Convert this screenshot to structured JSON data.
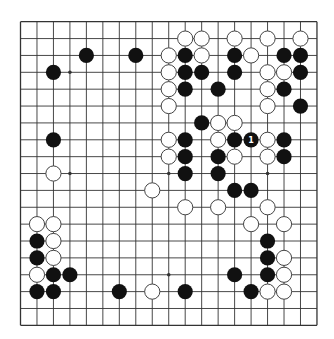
{
  "board": {
    "size": 19,
    "origin_x": 20.5,
    "origin_y": 21.7,
    "step_x": 16.47,
    "step_y": 16.87,
    "stone_radius": 7.6,
    "colors": {
      "background": "#ffffff",
      "line": "#333333",
      "black_stone": "#111111",
      "white_stone_fill": "#ffffff",
      "white_stone_stroke": "#444444",
      "mark": "#ffffff"
    },
    "hoshi": [
      [
        3,
        3
      ],
      [
        9,
        3
      ],
      [
        15,
        3
      ],
      [
        3,
        9
      ],
      [
        9,
        9
      ],
      [
        15,
        9
      ],
      [
        3,
        15
      ],
      [
        9,
        15
      ],
      [
        15,
        15
      ]
    ],
    "black": [
      [
        4,
        2
      ],
      [
        7,
        2
      ],
      [
        2,
        3
      ],
      [
        2,
        7
      ],
      [
        10,
        2
      ],
      [
        10,
        3
      ],
      [
        11,
        3
      ],
      [
        10,
        4
      ],
      [
        12,
        4
      ],
      [
        13,
        2
      ],
      [
        13,
        3
      ],
      [
        16,
        2
      ],
      [
        17,
        2
      ],
      [
        17,
        3
      ],
      [
        16,
        4
      ],
      [
        17,
        5
      ],
      [
        11,
        6
      ],
      [
        10,
        7
      ],
      [
        13,
        7
      ],
      [
        14,
        7
      ],
      [
        16,
        7
      ],
      [
        10,
        8
      ],
      [
        12,
        8
      ],
      [
        16,
        8
      ],
      [
        10,
        9
      ],
      [
        12,
        9
      ],
      [
        13,
        10
      ],
      [
        14,
        10
      ],
      [
        15,
        13
      ],
      [
        15,
        14
      ],
      [
        13,
        15
      ],
      [
        15,
        15
      ],
      [
        14,
        16
      ],
      [
        1,
        13
      ],
      [
        1,
        14
      ],
      [
        2,
        15
      ],
      [
        3,
        15
      ],
      [
        1,
        16
      ],
      [
        2,
        16
      ],
      [
        6,
        16
      ],
      [
        10,
        16
      ]
    ],
    "white": [
      [
        10,
        1
      ],
      [
        11,
        1
      ],
      [
        13,
        1
      ],
      [
        15,
        1
      ],
      [
        17,
        1
      ],
      [
        9,
        2
      ],
      [
        11,
        2
      ],
      [
        14,
        2
      ],
      [
        9,
        3
      ],
      [
        15,
        3
      ],
      [
        16,
        3
      ],
      [
        9,
        4
      ],
      [
        15,
        4
      ],
      [
        9,
        5
      ],
      [
        15,
        5
      ],
      [
        12,
        6
      ],
      [
        13,
        6
      ],
      [
        9,
        7
      ],
      [
        12,
        7
      ],
      [
        15,
        7
      ],
      [
        9,
        8
      ],
      [
        13,
        8
      ],
      [
        15,
        8
      ],
      [
        2,
        9
      ],
      [
        8,
        10
      ],
      [
        10,
        11
      ],
      [
        12,
        11
      ],
      [
        15,
        11
      ],
      [
        14,
        12
      ],
      [
        16,
        12
      ],
      [
        16,
        14
      ],
      [
        16,
        15
      ],
      [
        15,
        16
      ],
      [
        16,
        16
      ],
      [
        1,
        12
      ],
      [
        2,
        12
      ],
      [
        2,
        13
      ],
      [
        2,
        14
      ],
      [
        1,
        15
      ],
      [
        8,
        16
      ]
    ],
    "marked": [
      {
        "col": 14,
        "row": 7,
        "label": "1"
      }
    ]
  }
}
